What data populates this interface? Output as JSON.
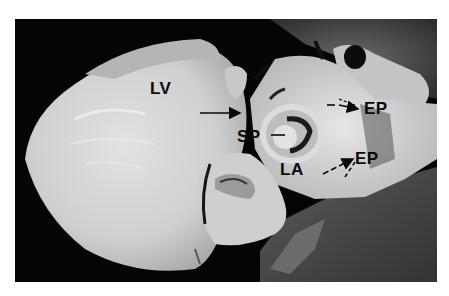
{
  "figure": {
    "labels": {
      "lv": "LV",
      "sp": "SP",
      "la": "LA",
      "ep_upper": "EP",
      "ep_lower": "EP"
    },
    "colors": {
      "background": "#050505",
      "tissue_light": "#d9d9d9",
      "tissue_mid": "#a8a8a8",
      "tissue_dark": "#3a3a3a",
      "label": "#0a0a0a"
    }
  }
}
